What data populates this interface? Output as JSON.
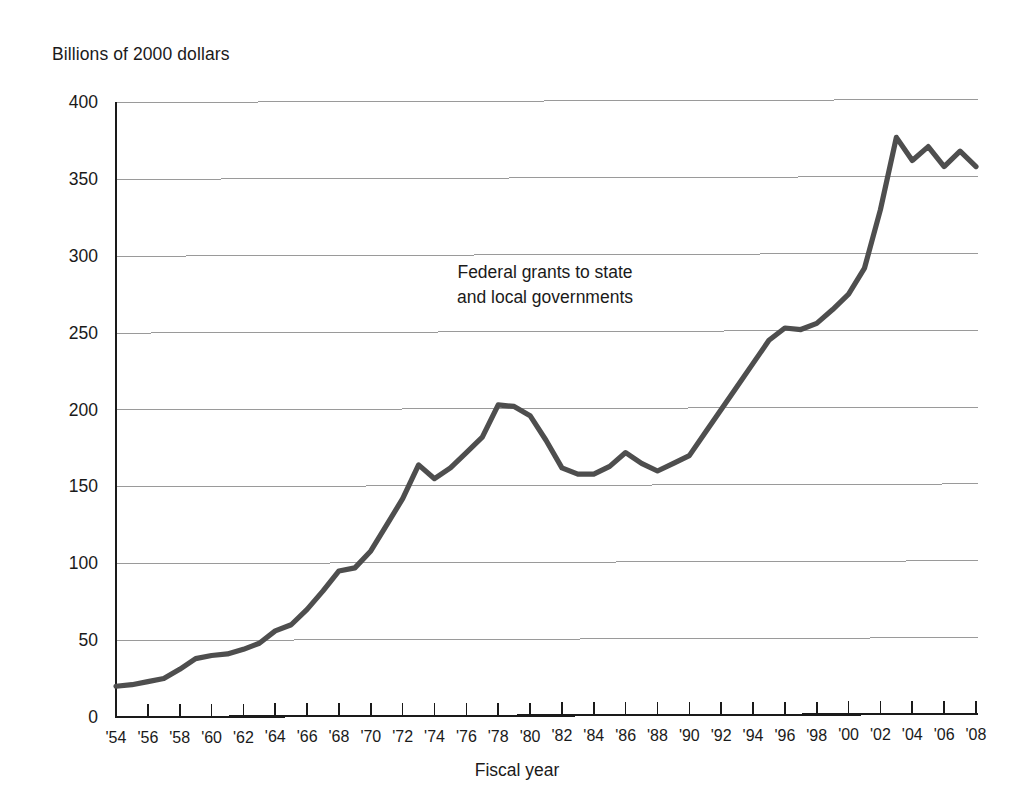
{
  "chart_data": {
    "type": "line",
    "title": "",
    "annotation": "Federal grants to state\nand local governments",
    "ylabel": "Billions of 2000 dollars",
    "xlabel": "Fiscal year",
    "ylim": [
      0,
      400
    ],
    "ytick_values": [
      0,
      50,
      100,
      150,
      200,
      250,
      300,
      350,
      400
    ],
    "ytick_labels": [
      "0",
      "50",
      "100",
      "150",
      "200",
      "250",
      "300",
      "350",
      "400"
    ],
    "grid": true,
    "grid_axis": "y",
    "legend": "none",
    "xlim": [
      1954,
      2008
    ],
    "xtick_labels": [
      "'54",
      "'56",
      "'58",
      "'60",
      "'62",
      "'64",
      "'66",
      "'68",
      "'70",
      "'72",
      "'74",
      "'76",
      "'78",
      "'80",
      "'82",
      "'84",
      "'86",
      "'88",
      "'90",
      "'92",
      "'94",
      "'96",
      "'98",
      "'00",
      "'02",
      "'04",
      "'06",
      "'08"
    ],
    "xtick_values": [
      1954,
      1956,
      1958,
      1960,
      1962,
      1964,
      1966,
      1968,
      1970,
      1972,
      1974,
      1976,
      1978,
      1980,
      1982,
      1984,
      1986,
      1988,
      1990,
      1992,
      1994,
      1996,
      1998,
      2000,
      2002,
      2004,
      2006,
      2008
    ],
    "line_color": "#4e4e4e",
    "grid_color": "#9a9a9a",
    "series": [
      {
        "name": "Federal grants to state and local governments",
        "x": [
          1954,
          1955,
          1956,
          1957,
          1958,
          1959,
          1960,
          1961,
          1962,
          1963,
          1964,
          1965,
          1966,
          1967,
          1968,
          1969,
          1970,
          1971,
          1972,
          1973,
          1974,
          1975,
          1976,
          1977,
          1978,
          1979,
          1980,
          1981,
          1982,
          1983,
          1984,
          1985,
          1986,
          1987,
          1988,
          1989,
          1990,
          1991,
          1992,
          1993,
          1994,
          1995,
          1996,
          1997,
          1998,
          1999,
          2000,
          2001,
          2002,
          2003,
          2004,
          2005,
          2006,
          2007,
          2008
        ],
        "y": [
          20,
          21,
          23,
          25,
          31,
          38,
          40,
          41,
          44,
          48,
          56,
          60,
          70,
          82,
          95,
          97,
          108,
          125,
          142,
          164,
          155,
          162,
          172,
          182,
          203,
          202,
          196,
          180,
          162,
          158,
          158,
          163,
          172,
          165,
          160,
          165,
          170,
          185,
          200,
          215,
          230,
          245,
          253,
          252,
          256,
          265,
          275,
          292,
          330,
          377,
          362,
          371,
          358,
          368,
          358
        ]
      }
    ]
  }
}
